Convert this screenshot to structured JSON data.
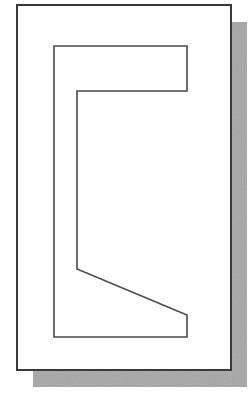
{
  "diagram": {
    "type": "profile-drawing",
    "canvas": {
      "width": 252,
      "height": 408,
      "background": "#ffffff"
    },
    "sheet": {
      "x": 17,
      "y": 5,
      "width": 214,
      "height": 365,
      "fill": "#ffffff",
      "stroke": "#3a3a3a",
      "stroke_width": 2
    },
    "shadow": {
      "offset_x": 16,
      "offset_y": 17,
      "fill": "#a6a6a6"
    },
    "profile": {
      "name": "c-profile-with-sloped-lower-flange",
      "points": [
        [
          54,
          46
        ],
        [
          187,
          46
        ],
        [
          187,
          91
        ],
        [
          77,
          91
        ],
        [
          77,
          269
        ],
        [
          187,
          315
        ],
        [
          187,
          337
        ],
        [
          54,
          337
        ]
      ],
      "fill": "none",
      "stroke": "#4a4a4a",
      "stroke_width": 1.6
    }
  }
}
